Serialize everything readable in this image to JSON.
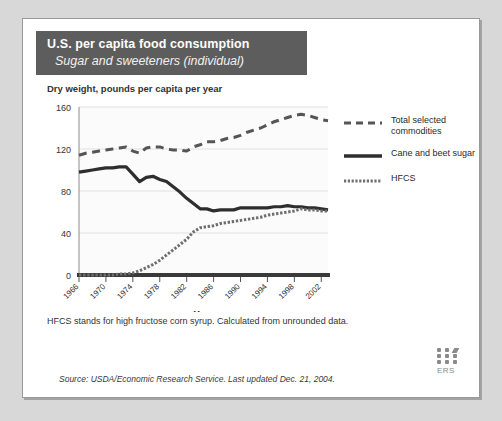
{
  "card": {
    "title_main": "U.S. per capita food consumption",
    "title_sub": "Sugar and sweeteners (individual)",
    "axis_note": "Dry weight, pounds per capita per year",
    "footnote": "HFCS stands for high fructose corn syrup. Calculated from unrounded data.",
    "source": "Source: USDA/Economic Research Service. Last updated Dec. 21, 2004.",
    "ers_label": "ERS"
  },
  "legend": {
    "position": "right",
    "entries": [
      {
        "label": "Total selected\ncommodities",
        "style": "dashed",
        "color": "#555555"
      },
      {
        "label": "Cane and beet sugar",
        "style": "solid",
        "color": "#2e2e2e"
      },
      {
        "label": "HFCS",
        "style": "dotted",
        "color": "#6e6e6e"
      }
    ]
  },
  "chart_data": {
    "type": "line",
    "xlabel": "Year",
    "ylabel": "Dry weight, pounds per capita per year",
    "xlim": [
      1966,
      2003
    ],
    "ylim": [
      0,
      160
    ],
    "yticks": [
      0,
      40,
      80,
      120,
      160
    ],
    "xticks": [
      1966,
      1970,
      1974,
      1978,
      1982,
      1986,
      1990,
      1994,
      1998,
      2002
    ],
    "grid": true,
    "x": [
      1966,
      1967,
      1968,
      1969,
      1970,
      1971,
      1972,
      1973,
      1974,
      1975,
      1976,
      1977,
      1978,
      1979,
      1980,
      1981,
      1982,
      1983,
      1984,
      1985,
      1986,
      1987,
      1988,
      1989,
      1990,
      1991,
      1992,
      1993,
      1994,
      1995,
      1996,
      1997,
      1998,
      1999,
      2000,
      2001,
      2002,
      2003
    ],
    "series": [
      {
        "name": "Total selected commodities",
        "style": "dashed",
        "color": "#555555",
        "values": [
          114,
          116,
          117,
          118,
          119,
          120,
          121,
          122,
          118,
          116,
          121,
          122,
          122,
          120,
          119,
          119,
          118,
          122,
          124,
          127,
          127,
          128,
          130,
          131,
          133,
          136,
          138,
          140,
          143,
          146,
          148,
          150,
          152,
          153,
          152,
          150,
          148,
          147
        ]
      },
      {
        "name": "Cane and beet sugar",
        "style": "solid",
        "color": "#2e2e2e",
        "values": [
          98,
          99,
          100,
          101,
          102,
          102,
          103,
          103,
          96,
          89,
          93,
          94,
          91,
          89,
          84,
          79,
          73,
          68,
          63,
          63,
          61,
          62,
          62,
          62,
          64,
          64,
          64,
          64,
          64,
          65,
          65,
          66,
          65,
          65,
          64,
          64,
          63,
          62
        ]
      },
      {
        "name": "HFCS",
        "style": "dotted",
        "color": "#6e6e6e",
        "values": [
          0,
          0,
          0,
          0,
          0,
          0,
          1,
          1,
          2,
          4,
          7,
          10,
          14,
          19,
          24,
          29,
          34,
          41,
          45,
          46,
          47,
          49,
          50,
          51,
          52,
          53,
          54,
          55,
          57,
          58,
          59,
          60,
          61,
          63,
          62,
          62,
          61,
          61
        ]
      }
    ]
  }
}
